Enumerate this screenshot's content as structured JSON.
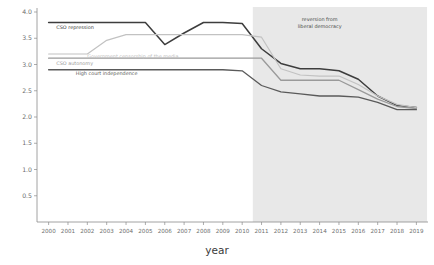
{
  "chart_data": {
    "type": "line",
    "title": "",
    "xlabel": "year",
    "ylabel": "",
    "ylim": [
      0.0,
      4.0
    ],
    "xlim": [
      2000,
      2019
    ],
    "grid": false,
    "legend_position": "inline-labels",
    "yticks": [
      "0.5",
      "1.0",
      "1.5",
      "2.0",
      "2.5",
      "3.0",
      "3.5",
      "4.0"
    ],
    "ytick_values": [
      0.5,
      1.0,
      1.5,
      2.0,
      2.5,
      3.0,
      3.5,
      4.0
    ],
    "x": [
      2000,
      2001,
      2002,
      2003,
      2004,
      2005,
      2006,
      2007,
      2008,
      2009,
      2010,
      2011,
      2012,
      2013,
      2014,
      2015,
      2016,
      2017,
      2018,
      2019
    ],
    "xticks": [
      "2000",
      "2001",
      "2002",
      "2003",
      "2004",
      "2005",
      "2006",
      "2007",
      "2008",
      "2009",
      "2010",
      "2011",
      "2012",
      "2013",
      "2014",
      "2015",
      "2016",
      "2017",
      "2018",
      "2019"
    ],
    "series": [
      {
        "name": "CSO repression",
        "color": "#3d3d3d",
        "width": 1.5,
        "label_x": 2000.4,
        "label_y": 3.68,
        "values": [
          3.8,
          3.8,
          3.8,
          3.8,
          3.8,
          3.8,
          3.38,
          3.6,
          3.8,
          3.8,
          3.78,
          3.3,
          3.02,
          2.92,
          2.92,
          2.88,
          2.72,
          2.4,
          2.22,
          2.18
        ]
      },
      {
        "name": "Government censorship of the media",
        "color": "#c2c2c2",
        "width": 1.2,
        "label_x": 2002.0,
        "label_y": 3.13,
        "values": [
          3.2,
          3.2,
          3.2,
          3.46,
          3.57,
          3.57,
          3.57,
          3.57,
          3.57,
          3.57,
          3.57,
          3.52,
          2.92,
          2.8,
          2.78,
          2.78,
          2.62,
          2.4,
          2.24,
          2.18
        ]
      },
      {
        "name": "CSO autonomy",
        "color": "#9a9a9a",
        "width": 1.3,
        "label_x": 2000.4,
        "label_y": 3.0,
        "values": [
          3.12,
          3.12,
          3.12,
          3.12,
          3.12,
          3.12,
          3.12,
          3.12,
          3.12,
          3.12,
          3.12,
          3.12,
          2.7,
          2.7,
          2.7,
          2.7,
          2.52,
          2.34,
          2.2,
          2.16
        ]
      },
      {
        "name": "High court independence",
        "color": "#5a5a5a",
        "width": 1.3,
        "label_x": 2001.4,
        "label_y": 2.8,
        "values": [
          2.9,
          2.9,
          2.9,
          2.9,
          2.9,
          2.9,
          2.9,
          2.9,
          2.9,
          2.9,
          2.88,
          2.6,
          2.48,
          2.44,
          2.4,
          2.4,
          2.38,
          2.28,
          2.14,
          2.14
        ]
      }
    ],
    "shaded_region": {
      "start": 2010.55,
      "end": 2019.55,
      "color": "#e4e4e4",
      "annotation": {
        "line1": "reversion from",
        "line2": "liberal democracy",
        "x": 2014.0,
        "y": 3.82
      }
    }
  }
}
